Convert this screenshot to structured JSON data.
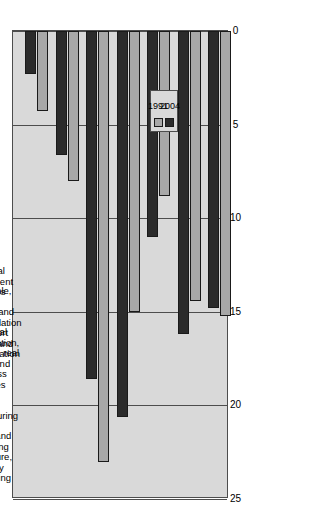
{
  "chart_data": {
    "type": "bar",
    "orientation": "horizontal",
    "title": "",
    "xlabel": "",
    "ylabel": "",
    "xlim": [
      0,
      25
    ],
    "xticks": [
      "0",
      "5",
      "10",
      "15",
      "20",
      "25"
    ],
    "grid": true,
    "legend_position": "bottom-left",
    "categories": [
      "Agriculture, forestry and fishing",
      "Mining and Quarrying",
      "Manufacturing",
      "Financial intermediation, insurance, real estate and business services",
      "Transport storage and communication",
      "Wholesale, retail, catering and accommodation",
      "General government services"
    ],
    "category_lines": [
      [
        "Agriculture,",
        "forestry",
        "and fishing"
      ],
      [
        "Mining and",
        "Quarrying"
      ],
      [
        "Manufacturing"
      ],
      [
        "Financial",
        "intermediation,",
        "insurance, real",
        "estate and",
        "business",
        "services"
      ],
      [
        "Transport",
        "storage and",
        "communication"
      ],
      [
        "Wholesale,",
        "retail,",
        "catering and",
        "accommodation"
      ],
      [
        "General",
        "government",
        "services"
      ]
    ],
    "series": [
      {
        "name": "1991",
        "color": "#a8a8a8",
        "values": [
          4.3,
          8.0,
          23.0,
          15.0,
          8.8,
          14.4,
          15.2
        ]
      },
      {
        "name": "2004",
        "color": "#2b2b2b",
        "values": [
          2.3,
          6.6,
          18.6,
          20.6,
          11.0,
          16.2,
          14.8
        ]
      }
    ]
  },
  "legend": {
    "entries": [
      {
        "label": "1991",
        "color": "#a8a8a8"
      },
      {
        "label": "2004",
        "color": "#2b2b2b"
      }
    ]
  },
  "axis": {
    "ticks": [
      "25",
      "20",
      "15",
      "10",
      "5",
      "0"
    ]
  }
}
